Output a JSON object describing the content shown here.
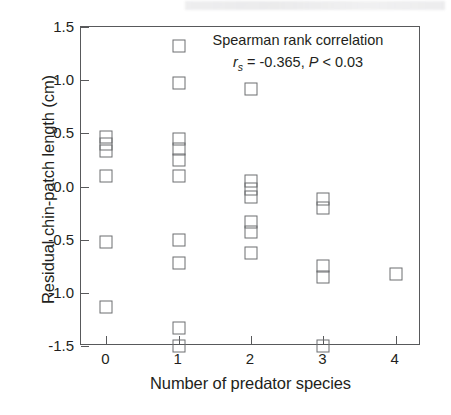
{
  "chart_data": {
    "type": "scatter",
    "title": "",
    "xlabel": "Number of predator species",
    "ylabel": "Residual chin-patch length (cm)",
    "xlim": [
      -0.35,
      4.35
    ],
    "ylim": [
      -1.5,
      1.5
    ],
    "grid": false,
    "legend": null,
    "xticks": [
      "0",
      "1",
      "2",
      "3",
      "4"
    ],
    "xtick_values": [
      0,
      1,
      2,
      3,
      4
    ],
    "yticks": [
      "1.5",
      "1.0",
      "0.5",
      "0.0",
      "-0.5",
      "-1.0",
      "-1.5"
    ],
    "ytick_values": [
      1.5,
      1.0,
      0.5,
      0.0,
      -0.5,
      -1.0,
      -1.5
    ],
    "marker": "open-square",
    "points": [
      {
        "x": 0,
        "y": 0.47
      },
      {
        "x": 0,
        "y": 0.4
      },
      {
        "x": 0,
        "y": 0.33
      },
      {
        "x": 0,
        "y": 0.1
      },
      {
        "x": 0,
        "y": -0.52
      },
      {
        "x": 0,
        "y": -1.13
      },
      {
        "x": 1,
        "y": 1.32
      },
      {
        "x": 1,
        "y": 0.97
      },
      {
        "x": 1,
        "y": 0.45
      },
      {
        "x": 1,
        "y": 0.35
      },
      {
        "x": 1,
        "y": 0.25
      },
      {
        "x": 1,
        "y": 0.1
      },
      {
        "x": 1,
        "y": -0.5
      },
      {
        "x": 1,
        "y": -0.72
      },
      {
        "x": 1,
        "y": -1.33
      },
      {
        "x": 1,
        "y": -1.5
      },
      {
        "x": 2,
        "y": 0.92
      },
      {
        "x": 2,
        "y": 0.05
      },
      {
        "x": 2,
        "y": -0.02
      },
      {
        "x": 2,
        "y": -0.1
      },
      {
        "x": 2,
        "y": -0.33
      },
      {
        "x": 2,
        "y": -0.43
      },
      {
        "x": 2,
        "y": -0.63
      },
      {
        "x": 3,
        "y": -0.12
      },
      {
        "x": 3,
        "y": -0.2
      },
      {
        "x": 3,
        "y": -0.75
      },
      {
        "x": 3,
        "y": -0.85
      },
      {
        "x": 3,
        "y": -1.5
      },
      {
        "x": 4,
        "y": -0.82
      }
    ],
    "annotations": [
      {
        "name": "spearman-annotation",
        "line1": "Spearman rank correlation",
        "statistic_symbol": "r",
        "statistic_subscript": "s",
        "statistic_value": "= -0.365,",
        "p_symbol": "P",
        "p_value": "< 0.03"
      }
    ]
  },
  "colors": {
    "axis": "#58595b",
    "marker_stroke": "#6d6e71",
    "text": "#231f20",
    "background": "#ffffff"
  }
}
